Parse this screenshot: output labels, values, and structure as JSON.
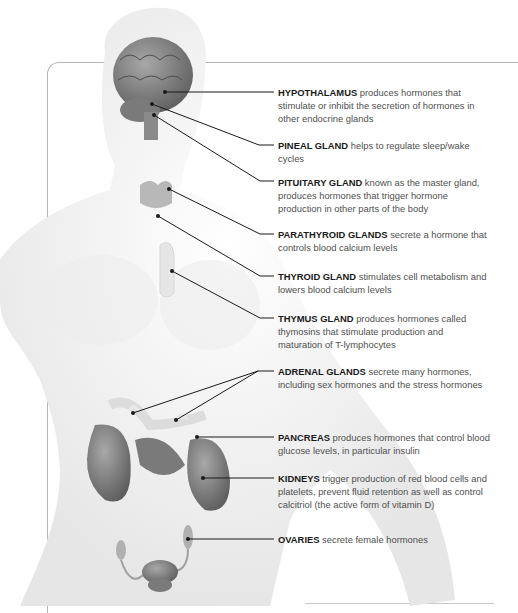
{
  "diagram": {
    "colors": {
      "text": "#505050",
      "label_bold": "#1a1a1a",
      "leader_line": "#1a1a1a",
      "organ": "#8a8a8a",
      "body": "#f2f2f2"
    },
    "labels": [
      {
        "id": "hypothalamus",
        "name": "HYPOTHALAMUS",
        "text": "produces hormones that stimulate or inhibit the secretion of hormones in other endocrine glands"
      },
      {
        "id": "pineal",
        "name": "PINEAL GLAND",
        "text": "helps to regulate sleep/wake cycles"
      },
      {
        "id": "pituitary",
        "name": "PITUITARY GLAND",
        "text": "known as the master gland, produces hormones that trigger hormone production in other parts of the body"
      },
      {
        "id": "parathyroid",
        "name": "PARATHYROID GLANDS",
        "text": "secrete a hormone that controls blood calcium levels"
      },
      {
        "id": "thyroid",
        "name": "THYROID GLAND",
        "text": "stimulates cell metabolism and lowers blood calcium levels"
      },
      {
        "id": "thymus",
        "name": "THYMUS GLAND",
        "text": "produces hormones called thymosins that stimulate production and maturation of T-lymphocytes"
      },
      {
        "id": "adrenal",
        "name": "ADRENAL GLANDS",
        "text": "secrete many hormones, including sex hormones and the stress hormones"
      },
      {
        "id": "pancreas",
        "name": "PANCREAS",
        "text": "produces hormones that control blood glucose levels, in particular insulin"
      },
      {
        "id": "kidneys",
        "name": "KIDNEYS",
        "text": "trigger production of red blood cells and platelets, prevent fluid retention as well as control calcitriol (the active form of vitamin D)"
      },
      {
        "id": "ovaries",
        "name": "OVARIES",
        "text": "secrete female hormones"
      }
    ]
  }
}
